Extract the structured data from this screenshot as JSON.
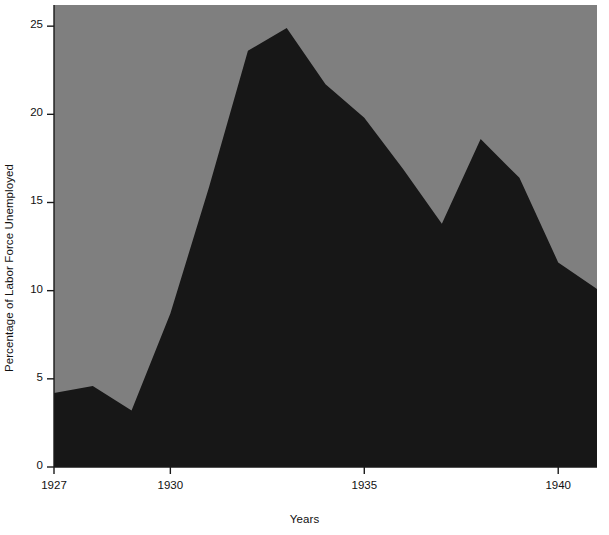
{
  "chart_data": {
    "type": "area",
    "title": "",
    "subtitle": "",
    "xlabel": "Years",
    "ylabel": "Percentage of Labor Force Unemployed",
    "x": [
      1927,
      1928,
      1929,
      1930,
      1931,
      1932,
      1933,
      1934,
      1935,
      1936,
      1937,
      1938,
      1939,
      1940,
      1941
    ],
    "values": [
      4.2,
      4.6,
      3.2,
      8.7,
      15.9,
      23.6,
      24.9,
      21.7,
      19.8,
      16.9,
      13.8,
      18.6,
      16.4,
      11.6,
      10.1
    ],
    "xlim": [
      1927,
      1941
    ],
    "ylim": [
      0,
      26.2
    ],
    "xticks": [
      1927,
      1930,
      1935,
      1940
    ],
    "xtick_labels": [
      "1927",
      "1930",
      "1935",
      "1940"
    ],
    "yticks": [
      0,
      5,
      10,
      15,
      20,
      25
    ],
    "ytick_labels": [
      "0",
      "5",
      "10",
      "15",
      "20",
      "25"
    ],
    "grid": false,
    "legend": null,
    "legend_position": "none",
    "series": [
      {
        "name": "Percentage of Labor Force Unemployed",
        "values": [
          4.2,
          4.6,
          3.2,
          8.7,
          15.9,
          23.6,
          24.9,
          21.7,
          19.8,
          16.9,
          13.8,
          18.6,
          16.4,
          11.6,
          10.1
        ]
      }
    ],
    "colors": {
      "area_fill": "#171717",
      "plot_background": "#7f7f7f",
      "figure_background": "#ffffff",
      "axis": "#1a1a1a",
      "text": "#111111"
    }
  }
}
